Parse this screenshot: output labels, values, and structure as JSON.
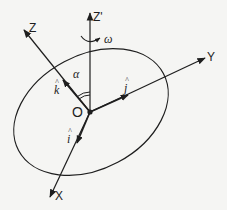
{
  "diagram": {
    "type": "rotating-disc-coordinate-frame",
    "colors": {
      "background": "#f5f5f3",
      "ink": "#1e1e1e"
    },
    "origin": {
      "label": "O",
      "x": 90,
      "y": 112
    },
    "axes": [
      {
        "id": "z-prime",
        "label": "Z'",
        "tip": [
          89,
          12
        ]
      },
      {
        "id": "z",
        "label": "Z",
        "tip": [
          23,
          29
        ]
      },
      {
        "id": "y",
        "label": "Y",
        "tip": [
          205,
          58
        ]
      },
      {
        "id": "x",
        "label": "X",
        "tip": [
          49,
          198
        ]
      }
    ],
    "unit_vectors": [
      {
        "id": "k-hat",
        "label": "k",
        "hat": "^",
        "on_axis": "Z"
      },
      {
        "id": "j-hat",
        "label": "j",
        "hat": "^",
        "on_axis": "Y"
      },
      {
        "id": "i-hat",
        "label": "i",
        "hat": "^",
        "on_axis": "X"
      }
    ],
    "angle": {
      "label": "α",
      "between": [
        "Z",
        "Z'"
      ]
    },
    "rotation": {
      "label": "ω",
      "about": "Z'"
    },
    "disc": {
      "shape": "ellipse",
      "cx": 91,
      "cy": 112,
      "rx": 82,
      "ry": 58,
      "rotation_deg": -28
    }
  }
}
